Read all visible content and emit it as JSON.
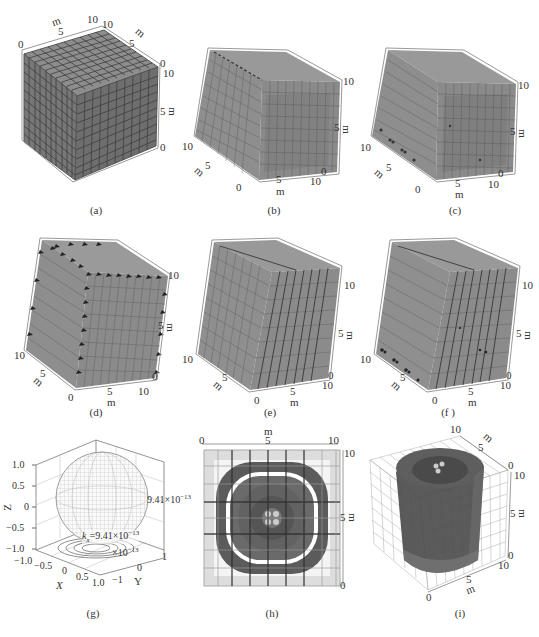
{
  "figure": {
    "caption": "",
    "colors": {
      "cube_face": "#7d7d7d",
      "cube_face_light": "#9a9a9a",
      "grid_line": "#3f3f3f",
      "ring_dark": "#5a5a5a",
      "text": "#333333"
    },
    "panels": [
      {
        "id": "a",
        "label": "(a)",
        "type": "3d-grid-cube",
        "unit": "m",
        "ticks_top": [
          "0",
          "5",
          "10"
        ],
        "ticks_right_depth": [
          "10",
          "5",
          "0"
        ],
        "ticks_vertical": [
          "10",
          "5",
          "0"
        ]
      },
      {
        "id": "b",
        "label": "(b)",
        "type": "3d-grid-cube",
        "unit": "m",
        "ticks_vertical": [
          "10",
          "5",
          "0"
        ],
        "ticks_bottom_front": [
          "0",
          "5",
          "10"
        ],
        "ticks_left_depth": [
          "10",
          "5",
          "0"
        ]
      },
      {
        "id": "c",
        "label": "(c)",
        "type": "3d-grid-cube",
        "unit": "m",
        "ticks_vertical": [
          "10",
          "5",
          "0"
        ],
        "ticks_bottom_front": [
          "0",
          "5",
          "10"
        ],
        "ticks_left_depth": [
          "10",
          "5",
          "0"
        ]
      },
      {
        "id": "d",
        "label": "(d)",
        "type": "3d-grid-cube",
        "unit": "m",
        "ticks_vertical": [
          "10",
          "5",
          "0"
        ],
        "ticks_bottom_front": [
          "0",
          "5",
          "10"
        ],
        "ticks_left_depth": [
          "10",
          "5",
          "0"
        ]
      },
      {
        "id": "e",
        "label": "(e)",
        "type": "3d-grid-cube",
        "unit": "m",
        "ticks_vertical": [
          "10",
          "5",
          "0"
        ],
        "ticks_bottom_front": [
          "0",
          "5",
          "10"
        ],
        "ticks_left_depth": [
          "10",
          "5",
          "0"
        ]
      },
      {
        "id": "f",
        "label": "(f )",
        "type": "3d-grid-cube",
        "unit": "m",
        "ticks_vertical": [
          "10",
          "5",
          "0"
        ],
        "ticks_bottom_front": [
          "0",
          "5",
          "10"
        ],
        "ticks_left_depth": [
          "10",
          "5",
          "0"
        ]
      },
      {
        "id": "g",
        "label": "(g)",
        "type": "3d-sphere",
        "z_axis_label": "Z",
        "x_axis_label": "X",
        "y_axis_label": "Y",
        "z_ticks": [
          "1.0",
          "0.5",
          "0",
          "−0.5",
          "−1.0"
        ],
        "x_ticks": [
          "−1.0",
          "−0.5",
          "0",
          "0.5",
          "1.0"
        ],
        "y_ticks": [
          "−1",
          "0",
          "1"
        ],
        "annotation_right": "9.41×10",
        "annotation_right_exp": "−13",
        "annotation_k_prefix": "k",
        "annotation_k_sub": "x",
        "annotation_k_value": "=9.41×10",
        "annotation_k_exp": "−13",
        "annotation_small": "×10",
        "annotation_small_exp": "−13"
      },
      {
        "id": "h",
        "label": "(h)",
        "type": "top-view-rings",
        "unit": "m",
        "ticks_top": [
          "0",
          "5",
          "10"
        ],
        "ticks_right": [
          "10",
          "5",
          "0"
        ]
      },
      {
        "id": "i",
        "label": "(i)",
        "type": "3d-cylinder-in-grid",
        "unit": "m",
        "ticks_top_depth": [
          "10",
          "5",
          "0"
        ],
        "ticks_vertical": [
          "10",
          "5",
          "0"
        ],
        "ticks_bottom_front": [
          "0",
          "5",
          "10"
        ]
      }
    ]
  }
}
